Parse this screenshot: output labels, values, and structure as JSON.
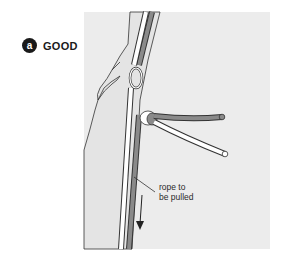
{
  "panel": {
    "badge": "a",
    "title": "GOOD"
  },
  "illustration": {
    "background_color": "#ececec",
    "rope_pulled_color": "#8a8a8a",
    "rope_other_color": "#ffffff",
    "outline_color": "#333333",
    "elements": [
      "rock-face",
      "anchor-ring",
      "knot",
      "rope-to-be-pulled",
      "other-rope-strand",
      "tail-ends",
      "pull-direction-arrow"
    ]
  },
  "callout": {
    "line1": "rope to",
    "line2": "be pulled"
  }
}
